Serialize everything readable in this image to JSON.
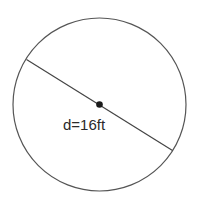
{
  "diagram": {
    "shape": "circle",
    "label": "d=16ft",
    "diameter_value": 16,
    "diameter_unit": "ft",
    "colors": {
      "stroke": "#555555",
      "center_dot": "#1a1a1a",
      "text": "#2a2a2a",
      "background": "#ffffff"
    }
  }
}
